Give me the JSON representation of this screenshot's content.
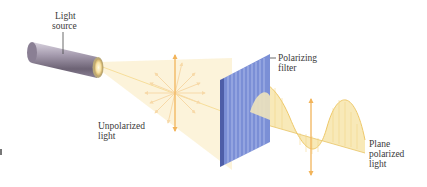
{
  "diagram": {
    "labels": {
      "light_source": [
        "Light",
        "source"
      ],
      "polarizing_filter": [
        "Polarizing",
        "filter"
      ],
      "unpolarized_light": [
        "Unpolarized",
        "light"
      ],
      "plane_polarized_light": [
        "Plane",
        "polarized",
        "light"
      ]
    },
    "colors": {
      "beam": "#fbf1d4",
      "arrow": "#f2b45a",
      "filter": "#7b8fd6",
      "filter_stripe": "#a8b6ea",
      "wave_fill": "#f7e7b0",
      "wave_line": "#eec868",
      "tube": "#8a7f94"
    }
  }
}
